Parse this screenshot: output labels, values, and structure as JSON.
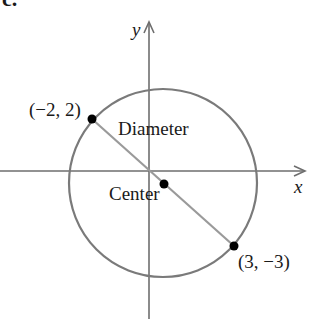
{
  "part_label": "c.",
  "axes": {
    "x_label": "x",
    "y_label": "y"
  },
  "points": [
    {
      "name": "endpoint-a",
      "label": "(−2, 2)",
      "x": -2,
      "y": 2
    },
    {
      "name": "center",
      "label": "Center",
      "x": 0.5,
      "y": -0.5
    },
    {
      "name": "endpoint-b",
      "label": "(3, −3)",
      "x": 3,
      "y": -3
    }
  ],
  "segment_label": "Diameter",
  "colors": {
    "axis": "#6e6e6e",
    "circle": "#7a7a7a",
    "diameter": "#9a9a9a",
    "point": "#000000",
    "text": "#1a1a1a"
  }
}
